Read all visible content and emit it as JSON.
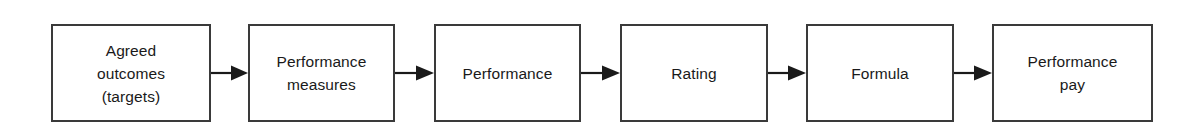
{
  "diagram": {
    "type": "linear-process-flow",
    "orientation": "left-to-right",
    "background_color": "#ffffff",
    "box_border_color": "#3a3a3a",
    "text_color": "#1a1a1a",
    "arrow_color": "#1a1a1a",
    "node_count": 6,
    "arrow_count": 5,
    "nodes": [
      {
        "id": "agreed-outcomes",
        "label": "Agreed\noutcomes\n(targets)",
        "lines": [
          "Agreed",
          "outcomes",
          "(targets)"
        ],
        "x": 51,
        "y": 24,
        "width": 160,
        "height": 98
      },
      {
        "id": "performance-measures",
        "label": "Performance\nmeasures",
        "lines": [
          "Performance",
          "measures"
        ],
        "x": 248,
        "y": 24,
        "width": 147,
        "height": 98
      },
      {
        "id": "performance",
        "label": "Performance",
        "lines": [
          "Performance"
        ],
        "x": 434,
        "y": 24,
        "width": 147,
        "height": 98
      },
      {
        "id": "rating",
        "label": "Rating",
        "lines": [
          "Rating"
        ],
        "x": 620,
        "y": 24,
        "width": 148,
        "height": 98
      },
      {
        "id": "formula",
        "label": "Formula",
        "lines": [
          "Formula"
        ],
        "x": 806,
        "y": 24,
        "width": 148,
        "height": 98
      },
      {
        "id": "performance-pay",
        "label": "Performance\npay",
        "lines": [
          "Performance",
          "pay"
        ],
        "x": 992,
        "y": 24,
        "width": 161,
        "height": 98
      }
    ],
    "arrows": [
      {
        "id": "arrow-1",
        "from": "agreed-outcomes",
        "to": "performance-measures",
        "x": 211,
        "y": 63,
        "length": 37
      },
      {
        "id": "arrow-2",
        "from": "performance-measures",
        "to": "performance",
        "x": 395,
        "y": 63,
        "length": 39
      },
      {
        "id": "arrow-3",
        "from": "performance",
        "to": "rating",
        "x": 581,
        "y": 63,
        "length": 39
      },
      {
        "id": "arrow-4",
        "from": "rating",
        "to": "formula",
        "x": 768,
        "y": 63,
        "length": 38
      },
      {
        "id": "arrow-5",
        "from": "formula",
        "to": "performance-pay",
        "x": 954,
        "y": 63,
        "length": 38
      }
    ]
  }
}
